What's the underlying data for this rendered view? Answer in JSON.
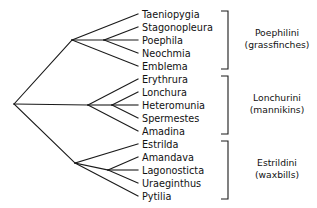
{
  "diagram": {
    "type": "cladogram",
    "title": "",
    "background_color": "#ffffff",
    "line_color": "#1a1a1a",
    "text_color": "#111111"
  },
  "taxa": [
    {
      "name": "Taeniopygia",
      "y": 14,
      "clade": 0
    },
    {
      "name": "Stagonopleura",
      "y": 27,
      "clade": 0
    },
    {
      "name": "Poephila",
      "y": 40,
      "clade": 0
    },
    {
      "name": "Neochmia",
      "y": 53,
      "clade": 0
    },
    {
      "name": "Emblema",
      "y": 66,
      "clade": 0
    },
    {
      "name": "Erythrura",
      "y": 79,
      "clade": 1
    },
    {
      "name": "Lonchura",
      "y": 92,
      "clade": 1
    },
    {
      "name": "Heteromunia",
      "y": 105,
      "clade": 1
    },
    {
      "name": "Spermestes",
      "y": 118,
      "clade": 1
    },
    {
      "name": "Amadina",
      "y": 131,
      "clade": 1
    },
    {
      "name": "Estrilda",
      "y": 144,
      "clade": 2
    },
    {
      "name": "Amandava",
      "y": 157,
      "clade": 2
    },
    {
      "name": "Lagonosticta",
      "y": 170,
      "clade": 2
    },
    {
      "name": "Uraeginthus",
      "y": 183,
      "clade": 2
    },
    {
      "name": "Pytilia",
      "y": 196,
      "clade": 2
    }
  ],
  "tribes": [
    {
      "name": "Poephilini",
      "common_name": "(grassfinches)",
      "bracket_top": 11,
      "bracket_bottom": 69,
      "label_x": 277,
      "label_y": 36
    },
    {
      "name": "Lonchurini",
      "common_name": "(mannikins)",
      "bracket_top": 76,
      "bracket_bottom": 134,
      "label_x": 277,
      "label_y": 101
    },
    {
      "name": "Estrildini",
      "common_name": "(waxbills)",
      "bracket_top": 141,
      "bracket_bottom": 199,
      "label_x": 277,
      "label_y": 166
    }
  ],
  "tree_geometry": {
    "tip_x": 138,
    "root_x": 14,
    "root_y": 104,
    "clade_nodes": [
      {
        "x": 72,
        "y": 40
      },
      {
        "x": 88,
        "y": 105
      },
      {
        "x": 75,
        "y": 163
      }
    ],
    "bracket_x": 228,
    "bracket_tick": 7
  },
  "branches": [
    {
      "name": "root-to-clade-poephilini",
      "x1": 14,
      "y1": 104,
      "x2": 72,
      "y2": 40
    },
    {
      "name": "root-to-clade-lonchurini",
      "x1": 14,
      "y1": 104,
      "x2": 88,
      "y2": 105
    },
    {
      "name": "root-to-clade-estrildini",
      "x1": 14,
      "y1": 104,
      "x2": 75,
      "y2": 163
    },
    {
      "name": "poephilini-node-to-taeniopygia",
      "x1": 72,
      "y1": 40,
      "x2": 138,
      "y2": 14
    },
    {
      "name": "poephilini-node-to-emblema",
      "x1": 72,
      "y1": 40,
      "x2": 138,
      "y2": 66
    },
    {
      "name": "poephilini-node-to-subnode",
      "x1": 72,
      "y1": 40,
      "x2": 104,
      "y2": 40
    },
    {
      "name": "poephilini-subnode-to-stagonopleura",
      "x1": 104,
      "y1": 40,
      "x2": 138,
      "y2": 27
    },
    {
      "name": "poephilini-subnode-to-poephila",
      "x1": 104,
      "y1": 40,
      "x2": 138,
      "y2": 40
    },
    {
      "name": "poephilini-subnode-to-neochmia",
      "x1": 104,
      "y1": 40,
      "x2": 138,
      "y2": 53
    },
    {
      "name": "lonchurini-node-to-erythrura",
      "x1": 88,
      "y1": 105,
      "x2": 138,
      "y2": 79
    },
    {
      "name": "lonchurini-node-to-amadina",
      "x1": 88,
      "y1": 105,
      "x2": 138,
      "y2": 131
    },
    {
      "name": "lonchurini-node-to-subnode",
      "x1": 88,
      "y1": 105,
      "x2": 112,
      "y2": 105
    },
    {
      "name": "lonchurini-subnode-to-lonchura",
      "x1": 112,
      "y1": 105,
      "x2": 138,
      "y2": 92
    },
    {
      "name": "lonchurini-subnode-to-heteromunia",
      "x1": 112,
      "y1": 105,
      "x2": 138,
      "y2": 105
    },
    {
      "name": "lonchurini-subnode-to-spermestes",
      "x1": 112,
      "y1": 105,
      "x2": 138,
      "y2": 118
    },
    {
      "name": "estrildini-node-to-estrilda",
      "x1": 75,
      "y1": 163,
      "x2": 138,
      "y2": 144
    },
    {
      "name": "estrildini-node-to-pytilia",
      "x1": 75,
      "y1": 163,
      "x2": 138,
      "y2": 196
    },
    {
      "name": "estrildini-node-to-subnode",
      "x1": 75,
      "y1": 163,
      "x2": 108,
      "y2": 170
    },
    {
      "name": "estrildini-subnode-to-amandava",
      "x1": 108,
      "y1": 170,
      "x2": 138,
      "y2": 157
    },
    {
      "name": "estrildini-subnode-to-lagonosticta",
      "x1": 108,
      "y1": 170,
      "x2": 138,
      "y2": 170
    },
    {
      "name": "estrildini-subnode-to-uraeginthus",
      "x1": 108,
      "y1": 170,
      "x2": 138,
      "y2": 183
    }
  ]
}
